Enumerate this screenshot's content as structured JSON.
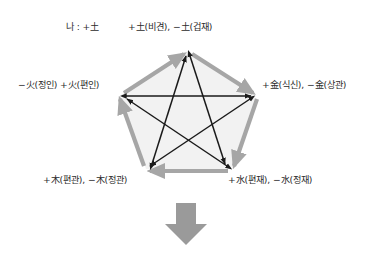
{
  "diagram": {
    "type": "pentagon-pentagram-cycle",
    "self_label": "나 : +土",
    "nodes": [
      {
        "id": "top",
        "element": "土",
        "label": "+土(비견), −土(겁재)"
      },
      {
        "id": "right",
        "element": "金",
        "label": "+金(식신), −金(상관)"
      },
      {
        "id": "bottom-right",
        "element": "水",
        "label": "+水(편재), −水(정재)"
      },
      {
        "id": "bottom-left",
        "element": "木",
        "label": "+木(편관), −木(정관)"
      },
      {
        "id": "left",
        "element": "火",
        "label": "−火(정인) +火(편인)"
      }
    ],
    "outer_cycle": [
      {
        "from": "left",
        "to": "top"
      },
      {
        "from": "top",
        "to": "right"
      },
      {
        "from": "right",
        "to": "bottom-right"
      },
      {
        "from": "bottom-right",
        "to": "bottom-left"
      },
      {
        "from": "bottom-left",
        "to": "left"
      }
    ],
    "inner_star": [
      {
        "from": "left",
        "to": "right",
        "double": true
      },
      {
        "from": "bottom-left",
        "to": "top",
        "double": true
      },
      {
        "from": "top",
        "to": "bottom-right",
        "double": true
      },
      {
        "from": "bottom-right",
        "to": "left",
        "double": true
      },
      {
        "from": "right",
        "to": "bottom-left",
        "double": true
      }
    ],
    "flow_arrow": {
      "direction": "down"
    },
    "colors": {
      "outer_arrow": "#a0a0a0",
      "inner_arrow": "#1a1a1a",
      "pentagon_fill": "#f2f2f2",
      "text": "#2b2b2b",
      "flow_arrow": "#9a9a9a"
    }
  }
}
